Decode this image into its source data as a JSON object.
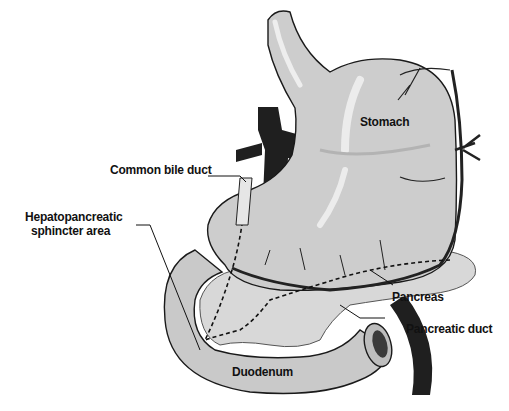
{
  "figure": {
    "type": "anatomical-illustration"
  },
  "labels": {
    "stomach": "Stomach",
    "common_bile_duct": "Common bile duct",
    "sphincter_line1": "Hepatopancreatic",
    "sphincter_line2": "sphincter area",
    "pancreas": "Pancreas",
    "pancreatic_duct": "Pancreatic duct",
    "duodenum": "Duodenum"
  },
  "colors": {
    "organ_fill": "#cfcfcf",
    "organ_highlight": "#ececec",
    "organ_outline": "#1a1a1a",
    "vessel": "#222222",
    "pancreas_fill": "#d8d8d8",
    "background": "#ffffff"
  }
}
